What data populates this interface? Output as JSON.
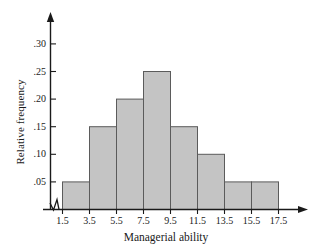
{
  "chart_data": {
    "type": "bar",
    "title": "",
    "subtitle": "",
    "xlabel": "Managerial ability",
    "ylabel": "Relative frequency",
    "grid": false,
    "legend": "none",
    "bin_edges": [
      1.5,
      3.5,
      5.5,
      7.5,
      9.5,
      11.5,
      13.5,
      15.5,
      17.5
    ],
    "categories": [
      "1.5-3.5",
      "3.5-5.5",
      "5.5-7.5",
      "7.5-9.5",
      "9.5-11.5",
      "11.5-13.5",
      "13.5-15.5",
      "15.5-17.5"
    ],
    "values": [
      0.05,
      0.15,
      0.2,
      0.25,
      0.15,
      0.1,
      0.05,
      0.05
    ],
    "xlim": [
      1.5,
      17.5
    ],
    "ylim": [
      0,
      0.325
    ],
    "xticks": [
      1.5,
      3.5,
      5.5,
      7.5,
      9.5,
      11.5,
      13.5,
      15.5,
      17.5
    ],
    "xtick_labels": [
      "1.5",
      "3.5",
      "5.5",
      "7.5",
      "9.5",
      "11.5",
      "13.5",
      "15.5",
      "17.5"
    ],
    "yticks": [
      0.05,
      0.1,
      0.15,
      0.2,
      0.25,
      0.3
    ],
    "ytick_labels": [
      ".05",
      ".10",
      ".15",
      ".20",
      ".25",
      ".30"
    ],
    "axis_break": "x-axis origin zigzag",
    "bar_fill_color": "#c4c4c4",
    "bar_border_color": "#5b5b5b",
    "axis_color": "#1a1a1a",
    "background_color": "#ffffff"
  }
}
